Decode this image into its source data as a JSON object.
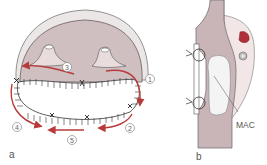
{
  "figure": {
    "panels": [
      {
        "id": "a",
        "label": "a",
        "steps": [
          "1",
          "2",
          "3",
          "4",
          "5"
        ],
        "description": "Oval wound with sutured margin and red directional arrows numbered 1-5"
      },
      {
        "id": "b",
        "label": "b",
        "annotations": [
          "MAC"
        ],
        "description": "Cross-section with sutures on left and white mass labeled MAC"
      }
    ],
    "colors": {
      "arrow": "#b83a3a",
      "tissue": "#c9b5b8",
      "tissue_light": "#ecdfe0",
      "rim": "#e8e4e4",
      "outline": "#555555",
      "mass": "#f2f2f2",
      "vessel_red": "#b0303a",
      "vessel_gray": "#a8a8a8"
    }
  }
}
